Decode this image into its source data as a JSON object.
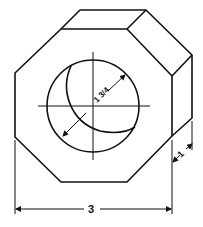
{
  "figure": {
    "dimensions": {
      "width_label": "3",
      "depth_label": "1",
      "bore_diameter_label": "1 3/4"
    },
    "colors": {
      "line": "#111111",
      "background": "#ffffff"
    }
  }
}
